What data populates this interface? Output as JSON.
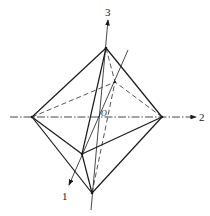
{
  "diagram": {
    "type": "octahedron with principal axes",
    "axes": [
      {
        "id": "axis-1",
        "label": "1"
      },
      {
        "id": "axis-2",
        "label": "2"
      },
      {
        "id": "axis-3",
        "label": "3"
      }
    ],
    "origin_label": "O",
    "vertices": {
      "top": [
        106,
        48
      ],
      "bottom": [
        92,
        193
      ],
      "left": [
        32,
        117
      ],
      "right": [
        162,
        117
      ],
      "front": [
        82,
        154
      ],
      "back": [
        115,
        82
      ]
    },
    "colors": {
      "line": "#1a1a1a",
      "background": "#ffffff"
    }
  }
}
